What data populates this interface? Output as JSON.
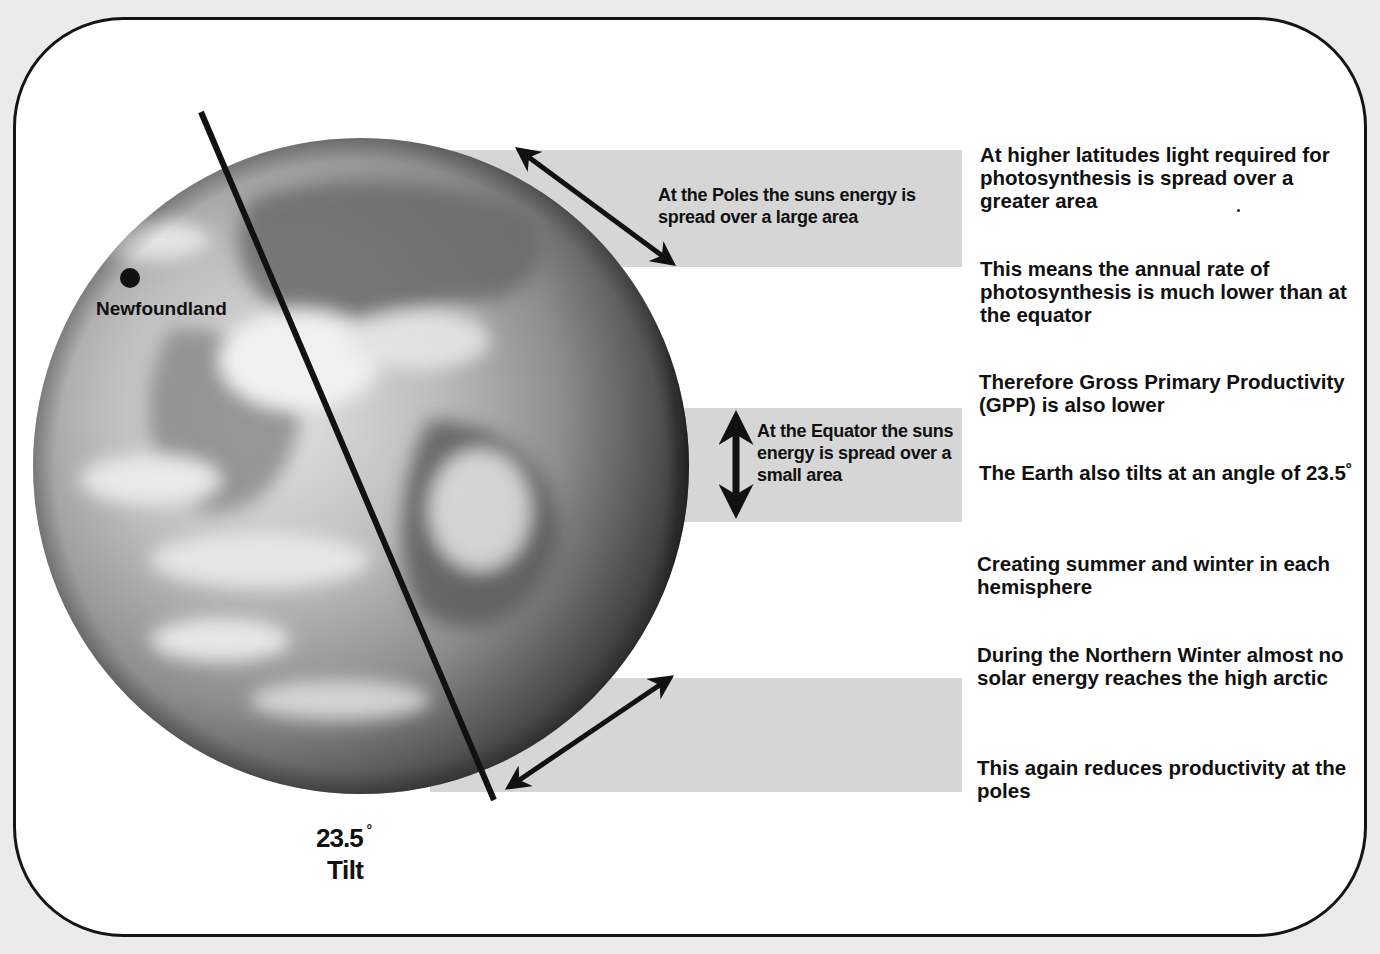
{
  "diagram": {
    "globe_labels": {
      "location_marker": "Newfoundland",
      "tilt_angle": "23.5",
      "tilt_degree_symbol": "°",
      "tilt_word": "Tilt"
    },
    "band_annotations": {
      "poles": "At the Poles the suns energy is spread over a large area",
      "equator": "At the Equator the suns energy is spread over a small area"
    },
    "notes": [
      "At higher latitudes light required for photosynthesis is spread over a greater area",
      "This means the annual rate of photosynthesis is much lower than at the equator",
      "Therefore Gross Primary Productivity (GPP) is also lower",
      "The Earth also tilts at an angle of 23.5˚",
      "Creating summer and winter in each hemisphere",
      "During the Northern Winter almost no solar energy reaches the high arctic",
      "This again reduces productivity at the poles"
    ],
    "colors": {
      "background": "#ebebeb",
      "card": "#ffffff",
      "band": "#d6d6d6",
      "ink": "#111111"
    }
  }
}
